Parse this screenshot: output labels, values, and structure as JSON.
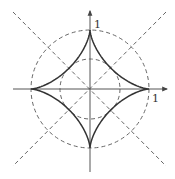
{
  "diagram": {
    "type": "astroid",
    "y_axis_label": "1",
    "x_axis_label": "1",
    "colors": {
      "curve": "#333333",
      "axis": "#555555",
      "dashed": "#555555",
      "background": "#ffffff"
    },
    "elements": [
      {
        "name": "astroid",
        "style": "solid",
        "cusps": [
          [
            1,
            0
          ],
          [
            0,
            1
          ],
          [
            -1,
            0
          ],
          [
            0,
            -1
          ]
        ]
      },
      {
        "name": "outer-circle",
        "style": "dashed",
        "radius": 1
      },
      {
        "name": "inner-circle",
        "style": "dashed",
        "radius": 0.5
      },
      {
        "name": "diagonal-line-1",
        "style": "dashed",
        "slope": 1
      },
      {
        "name": "diagonal-line-2",
        "style": "dashed",
        "slope": -1
      },
      {
        "name": "x-axis",
        "style": "solid-arrow"
      },
      {
        "name": "y-axis",
        "style": "solid-arrow"
      }
    ]
  }
}
